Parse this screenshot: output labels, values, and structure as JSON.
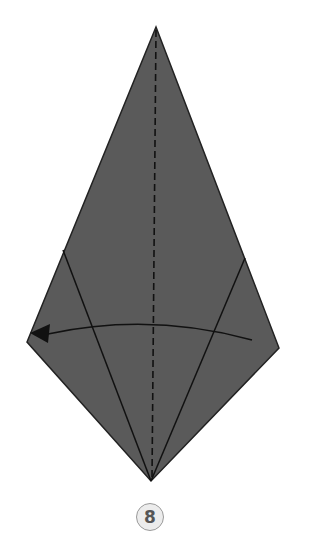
{
  "diagram": {
    "type": "origami-fold-step",
    "step_number": "8",
    "colors": {
      "paper": "#5a5a5a",
      "line": "#111111",
      "badge_bg": "#ececec",
      "badge_text": "#555555"
    },
    "shape": {
      "top": [
        156,
        27
      ],
      "left": [
        27,
        342
      ],
      "bottom": [
        151,
        481
      ],
      "right": [
        279,
        348
      ]
    },
    "instruction": "fold right flap to the left along center crease"
  }
}
